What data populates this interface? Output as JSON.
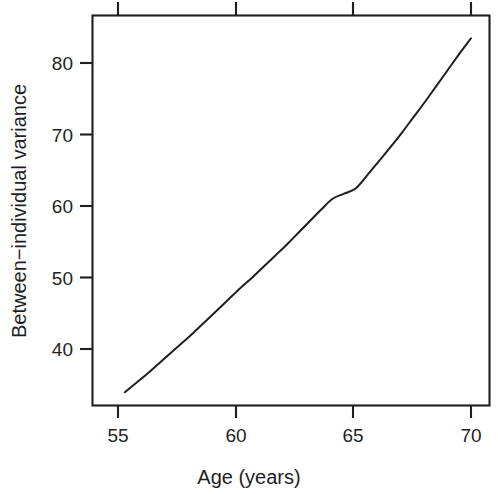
{
  "chart_data": {
    "type": "line",
    "title": "",
    "subtitle": "",
    "xlabel": "Age (years)",
    "ylabel": "Between−individual variance",
    "xlim": [
      53.6,
      70.8
    ],
    "ylim": [
      33.2,
      86.4
    ],
    "grid": false,
    "legend": null,
    "x_ticks": [
      55,
      60,
      65,
      70
    ],
    "x_tick_labels": [
      "55",
      "60",
      "65",
      "70"
    ],
    "y_ticks": [
      40,
      50,
      60,
      70,
      80
    ],
    "y_tick_labels": [
      "40",
      "50",
      "60",
      "70",
      "80"
    ],
    "series": [
      {
        "name": "Between-individual variance",
        "color": "#1f1f1f",
        "x": [
          55.0,
          55.5,
          56.0,
          56.5,
          57.0,
          57.5,
          58.0,
          58.5,
          59.0,
          59.5,
          60.0,
          60.5,
          61.0,
          61.5,
          62.0,
          62.5,
          63.0,
          63.5,
          64.0,
          64.5,
          65.0,
          65.5,
          66.0,
          66.5,
          67.0,
          67.5,
          68.0,
          68.5,
          69.0,
          69.5,
          70.0
        ],
        "values": [
          35.0,
          36.3,
          37.6,
          39.0,
          40.4,
          41.8,
          43.2,
          44.7,
          46.2,
          47.7,
          49.2,
          50.6,
          52.1,
          53.6,
          55.1,
          56.7,
          58.3,
          59.9,
          61.4,
          62.1,
          62.8,
          64.6,
          66.5,
          68.4,
          70.4,
          72.5,
          74.6,
          76.8,
          79.0,
          81.2,
          83.3
        ]
      }
    ],
    "annotations": [],
    "axis_style": "box-frame-with-outward-ticks",
    "line_style": "solid",
    "background_color": "#ffffff",
    "foreground_color": "#1f1f1f"
  },
  "axis_titles": {
    "x": "Age (years)",
    "y": "Between−individual variance"
  }
}
